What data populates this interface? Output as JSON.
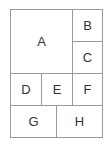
{
  "diagram": {
    "type": "grid-layout",
    "cells": [
      {
        "label": "A",
        "x": 10,
        "y": 9,
        "w": 63,
        "h": 65
      },
      {
        "label": "B",
        "x": 72,
        "y": 9,
        "w": 31,
        "h": 33
      },
      {
        "label": "C",
        "x": 72,
        "y": 41,
        "w": 31,
        "h": 33
      },
      {
        "label": "D",
        "x": 10,
        "y": 73,
        "w": 32,
        "h": 33
      },
      {
        "label": "E",
        "x": 41,
        "y": 73,
        "w": 32,
        "h": 33
      },
      {
        "label": "F",
        "x": 72,
        "y": 73,
        "w": 31,
        "h": 33
      },
      {
        "label": "G",
        "x": 10,
        "y": 105,
        "w": 47,
        "h": 33
      },
      {
        "label": "H",
        "x": 56,
        "y": 105,
        "w": 47,
        "h": 33
      }
    ],
    "border_color": "#9a9a9a"
  }
}
